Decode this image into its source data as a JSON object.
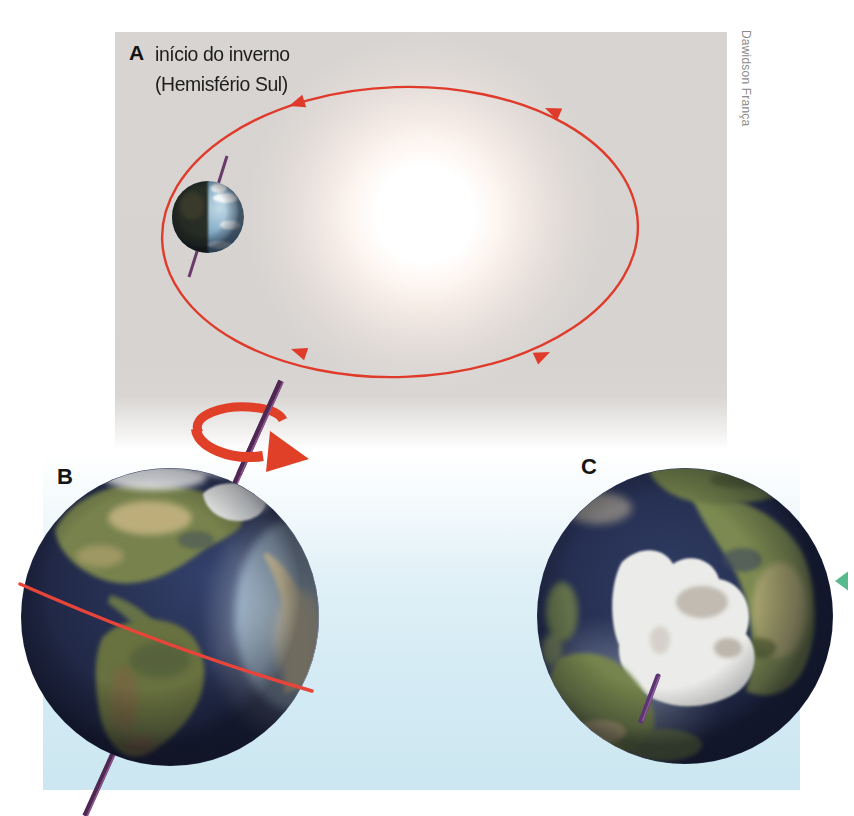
{
  "figure": {
    "credit": "Dawidson França",
    "panels": {
      "a": {
        "label": "A",
        "caption_line1": "início do inverno",
        "caption_line2": "(Hemisfério Sul)"
      },
      "b": {
        "label": "B"
      },
      "c": {
        "label": "C"
      }
    },
    "icons": {
      "orbit_arrows": "red-triangle-arrowheads-on-ellipse",
      "rotation_arrow": "red-curved-ribbon-arrow",
      "marker": "teal-left-pointing-triangle"
    },
    "colors": {
      "panel_background": "#d6d3d0",
      "orbit_red": "#e03a2b",
      "rotation_arrow_red": "#e04028",
      "equator_red": "#e8453a",
      "axis_purple": "#4f2753",
      "axis_highlight": "#a064a0",
      "marker_teal": "#58ba8c",
      "sky_blue": "#cfe9f3",
      "credit_gray": "#8c8c8c"
    }
  }
}
